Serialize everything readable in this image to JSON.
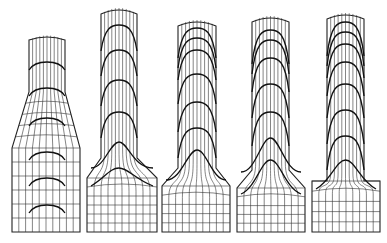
{
  "figure": {
    "line_color": "#222222",
    "background": "#ffffff"
  },
  "meshes": [
    {
      "id": "stage-1",
      "colL": 29,
      "colR": 65,
      "top": 37,
      "topBulge": 3,
      "shoulderY": 148,
      "shoulderTopY": 92,
      "baseL": 12,
      "baseR": 80,
      "baseTop": 148,
      "bottom": 232,
      "vlines": 10,
      "baseCols": 10,
      "baseRows": 6,
      "fronts": [
        62,
        88,
        118,
        152,
        178,
        205
      ],
      "frontPeak": 8,
      "squareShoulder": false,
      "conical": true
    },
    {
      "id": "stage-2",
      "colL": 101,
      "colR": 137,
      "top": 10,
      "topBulge": 4,
      "shoulderY": 178,
      "shoulderTopY": 158,
      "baseL": 87,
      "baseR": 157,
      "baseTop": 178,
      "bottom": 232,
      "vlines": 10,
      "baseCols": 10,
      "baseRows": 6,
      "fronts": [
        25,
        50,
        80,
        112,
        142,
        168
      ],
      "frontPeak": 26,
      "squareShoulder": false,
      "conical": false
    },
    {
      "id": "stage-3",
      "colL": 178,
      "colR": 216,
      "top": 22,
      "topBulge": 4,
      "shoulderY": 186,
      "shoulderTopY": 168,
      "baseL": 162,
      "baseR": 230,
      "baseTop": 186,
      "bottom": 232,
      "vlines": 10,
      "baseCols": 10,
      "baseRows": 5,
      "fronts": [
        28,
        38,
        50,
        74,
        102,
        128,
        150
      ],
      "frontPeak": 30,
      "squareShoulder": false,
      "conical": false
    },
    {
      "id": "stage-4",
      "colL": 252,
      "colR": 289,
      "top": 18,
      "topBulge": 4,
      "shoulderY": 188,
      "shoulderTopY": 170,
      "baseL": 237,
      "baseR": 305,
      "baseTop": 188,
      "bottom": 232,
      "vlines": 10,
      "baseCols": 10,
      "baseRows": 5,
      "fronts": [
        30,
        40,
        58,
        84,
        112,
        138,
        160
      ],
      "frontPeak": 34,
      "squareShoulder": false,
      "conical": false
    },
    {
      "id": "stage-5",
      "colL": 327,
      "colR": 364,
      "top": 15,
      "topBulge": 4,
      "shoulderY": 181,
      "shoulderTopY": 181,
      "baseL": 312,
      "baseR": 380,
      "baseTop": 181,
      "bottom": 232,
      "vlines": 10,
      "baseCols": 10,
      "baseRows": 5,
      "fronts": [
        22,
        32,
        44,
        62,
        84,
        110,
        136,
        160
      ],
      "frontPeak": 34,
      "squareShoulder": true,
      "conical": false
    }
  ]
}
